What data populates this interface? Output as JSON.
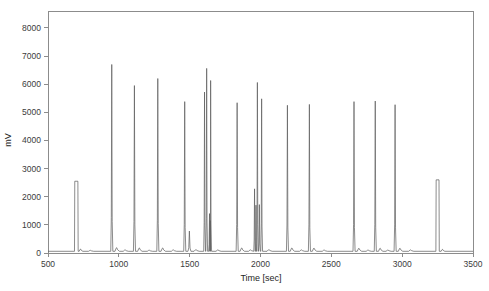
{
  "chart_data": {
    "type": "line",
    "title": "",
    "subtitle": "",
    "xlabel": "Time [sec]",
    "ylabel": "mV",
    "xlim": [
      500,
      3500
    ],
    "ylim": [
      0,
      8600
    ],
    "xticks": [
      500,
      1000,
      1500,
      2000,
      2500,
      3000,
      3500
    ],
    "xtick_labels": [
      "500",
      "1000",
      "1500",
      "2000",
      "2500",
      "3000",
      "3500"
    ],
    "yticks": [
      0,
      1000,
      2000,
      3000,
      4000,
      5000,
      6000,
      7000,
      8000
    ],
    "ytick_labels": [
      "0",
      "1000",
      "2000",
      "3000",
      "4000",
      "5000",
      "6000",
      "7000",
      "8000"
    ],
    "grid": false,
    "legend": false,
    "legend_position": "none",
    "baseline_mv": 60,
    "series": [
      {
        "name": "detector-signal",
        "color": "#5a5a5a",
        "peaks": [
          {
            "time": 700,
            "height": 2550,
            "width": 22,
            "shape": "flat"
          },
          {
            "time": 730,
            "height": 140,
            "width": 10,
            "shape": "bump"
          },
          {
            "time": 800,
            "height": 95,
            "width": 14,
            "shape": "bump"
          },
          {
            "time": 950,
            "height": 6700,
            "width": 7,
            "shape": "sharp"
          },
          {
            "time": 985,
            "height": 190,
            "width": 12,
            "shape": "bump"
          },
          {
            "time": 1045,
            "height": 110,
            "width": 14,
            "shape": "bump"
          },
          {
            "time": 1110,
            "height": 5950,
            "width": 7,
            "shape": "sharp"
          },
          {
            "time": 1145,
            "height": 180,
            "width": 12,
            "shape": "bump"
          },
          {
            "time": 1215,
            "height": 100,
            "width": 14,
            "shape": "bump"
          },
          {
            "time": 1275,
            "height": 6200,
            "width": 7,
            "shape": "sharp"
          },
          {
            "time": 1310,
            "height": 180,
            "width": 12,
            "shape": "bump"
          },
          {
            "time": 1385,
            "height": 110,
            "width": 14,
            "shape": "bump"
          },
          {
            "time": 1465,
            "height": 5380,
            "width": 7,
            "shape": "sharp"
          },
          {
            "time": 1498,
            "height": 780,
            "width": 10,
            "shape": "sharp"
          },
          {
            "time": 1545,
            "height": 120,
            "width": 14,
            "shape": "bump"
          },
          {
            "time": 1605,
            "height": 5720,
            "width": 6,
            "shape": "sharp"
          },
          {
            "time": 1620,
            "height": 6560,
            "width": 6,
            "shape": "sharp"
          },
          {
            "time": 1640,
            "height": 1400,
            "width": 6,
            "shape": "sharp"
          },
          {
            "time": 1648,
            "height": 6130,
            "width": 6,
            "shape": "sharp"
          },
          {
            "time": 1700,
            "height": 110,
            "width": 14,
            "shape": "bump"
          },
          {
            "time": 1835,
            "height": 5340,
            "width": 7,
            "shape": "sharp"
          },
          {
            "time": 1868,
            "height": 180,
            "width": 12,
            "shape": "bump"
          },
          {
            "time": 1930,
            "height": 110,
            "width": 14,
            "shape": "bump"
          },
          {
            "time": 1958,
            "height": 2280,
            "width": 6,
            "shape": "sharp"
          },
          {
            "time": 1968,
            "height": 1700,
            "width": 6,
            "shape": "sharp"
          },
          {
            "time": 1978,
            "height": 6060,
            "width": 6,
            "shape": "sharp"
          },
          {
            "time": 1992,
            "height": 1720,
            "width": 6,
            "shape": "sharp"
          },
          {
            "time": 2008,
            "height": 5480,
            "width": 6,
            "shape": "sharp"
          },
          {
            "time": 2060,
            "height": 120,
            "width": 14,
            "shape": "bump"
          },
          {
            "time": 2190,
            "height": 5250,
            "width": 7,
            "shape": "sharp"
          },
          {
            "time": 2222,
            "height": 180,
            "width": 12,
            "shape": "bump"
          },
          {
            "time": 2290,
            "height": 110,
            "width": 14,
            "shape": "bump"
          },
          {
            "time": 2345,
            "height": 5280,
            "width": 7,
            "shape": "sharp"
          },
          {
            "time": 2378,
            "height": 175,
            "width": 12,
            "shape": "bump"
          },
          {
            "time": 2450,
            "height": 105,
            "width": 14,
            "shape": "bump"
          },
          {
            "time": 2660,
            "height": 5380,
            "width": 7,
            "shape": "sharp"
          },
          {
            "time": 2695,
            "height": 170,
            "width": 12,
            "shape": "bump"
          },
          {
            "time": 2760,
            "height": 105,
            "width": 14,
            "shape": "bump"
          },
          {
            "time": 2810,
            "height": 5400,
            "width": 7,
            "shape": "sharp"
          },
          {
            "time": 2845,
            "height": 170,
            "width": 12,
            "shape": "bump"
          },
          {
            "time": 2900,
            "height": 105,
            "width": 14,
            "shape": "bump"
          },
          {
            "time": 2950,
            "height": 5270,
            "width": 7,
            "shape": "sharp"
          },
          {
            "time": 2985,
            "height": 170,
            "width": 12,
            "shape": "bump"
          },
          {
            "time": 3060,
            "height": 110,
            "width": 14,
            "shape": "bump"
          },
          {
            "time": 3250,
            "height": 2600,
            "width": 20,
            "shape": "flat"
          },
          {
            "time": 3285,
            "height": 130,
            "width": 10,
            "shape": "bump"
          }
        ]
      }
    ]
  },
  "layout": {
    "plot_left": 48,
    "plot_right": 473,
    "plot_top": 11,
    "plot_bottom": 253,
    "frame_color": "#8c8c8c",
    "trace_color": "#5a5a5a",
    "background": "#ffffff"
  }
}
